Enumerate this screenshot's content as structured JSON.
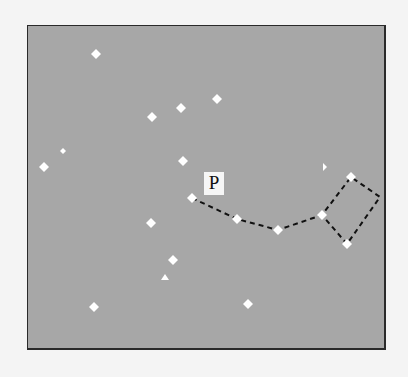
{
  "figure": {
    "type": "star-field-path-diagram",
    "background_color": "#a7a7a7",
    "page_color": "#f4f4f4",
    "frame_color": "#2a2a2a",
    "point_color": "#ffffff",
    "path_color": "#111111",
    "label": {
      "text": "P",
      "x": 176,
      "y": 146
    },
    "points": [
      {
        "x": 68,
        "y": 28,
        "shape": "diamond"
      },
      {
        "x": 124,
        "y": 91,
        "shape": "diamond"
      },
      {
        "x": 153,
        "y": 82,
        "shape": "diamond"
      },
      {
        "x": 189,
        "y": 73,
        "shape": "diamond"
      },
      {
        "x": 35,
        "y": 125,
        "shape": "diamond-small"
      },
      {
        "x": 16,
        "y": 141,
        "shape": "diamond"
      },
      {
        "x": 155,
        "y": 135,
        "shape": "diamond"
      },
      {
        "x": 297,
        "y": 141,
        "shape": "fragment"
      },
      {
        "x": 164,
        "y": 172,
        "shape": "diamond"
      },
      {
        "x": 209,
        "y": 193,
        "shape": "diamond"
      },
      {
        "x": 250,
        "y": 204,
        "shape": "diamond"
      },
      {
        "x": 294,
        "y": 189,
        "shape": "diamond"
      },
      {
        "x": 323,
        "y": 151,
        "shape": "diamond"
      },
      {
        "x": 319,
        "y": 218,
        "shape": "diamond"
      },
      {
        "x": 123,
        "y": 197,
        "shape": "diamond"
      },
      {
        "x": 145,
        "y": 234,
        "shape": "diamond"
      },
      {
        "x": 137,
        "y": 252,
        "shape": "triangle"
      },
      {
        "x": 66,
        "y": 281,
        "shape": "diamond"
      },
      {
        "x": 220,
        "y": 278,
        "shape": "diamond"
      }
    ],
    "path": [
      {
        "x": 164,
        "y": 172
      },
      {
        "x": 209,
        "y": 193
      },
      {
        "x": 250,
        "y": 204
      },
      {
        "x": 294,
        "y": 189
      },
      {
        "x": 323,
        "y": 151
      },
      {
        "x": 352,
        "y": 171
      },
      {
        "x": 319,
        "y": 218
      },
      {
        "x": 294,
        "y": 189
      }
    ]
  }
}
